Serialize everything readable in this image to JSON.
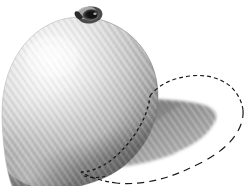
{
  "scene": {
    "title": "Rendered sphere with cast shadow and selection outline",
    "canvas_width": 248,
    "canvas_height": 186,
    "background_color": "#ffffff"
  },
  "object": {
    "name": "textured-sphere",
    "description": "Light gray sphere with diagonal woven texture, stem at top",
    "center_x": 80,
    "center_y": 97,
    "radius_x": 78,
    "radius_y": 80,
    "highlight_x": 52,
    "highlight_y": 58,
    "highlight_color": "#fbfbfb",
    "midtone_color": "#cfcfcf",
    "terminator_color": "#8f8f8f",
    "edge_color": "#6f6f6f",
    "texture_angle_deg": 55,
    "texture_spacing_px": 4,
    "texture_contrast": "low"
  },
  "stem": {
    "name": "stem-calyx",
    "center_x": 90,
    "center_y": 14,
    "width": 22,
    "height": 16,
    "outer_color": "#4a4a4a",
    "inner_color": "#141414",
    "rim_color": "#b9b9b9"
  },
  "shadow": {
    "name": "cast-shadow",
    "description": "Gray crescent cast shadow extending to the lower right",
    "fill_near": "#7e7e7e",
    "fill_far": "#a9a9a9",
    "fill_edge": "#c6c6c6",
    "opacity": 1
  },
  "selection": {
    "name": "marching-ants-selection",
    "description": "Dashed selection outline enclosing the shadow region",
    "stroke_color": "#1a1a1a",
    "stroke_width": 1.2,
    "dash_pattern": "4 3",
    "segments": [
      {
        "label": "top-edge",
        "dash": "4 3"
      },
      {
        "label": "right-edge",
        "dash": "7 5"
      },
      {
        "label": "bottom-edge",
        "dash": "4 3"
      },
      {
        "label": "sphere-edge",
        "dash": "3 3"
      }
    ]
  },
  "colors": {
    "white": "#ffffff",
    "light_gray": "#e4e4e4",
    "mid_gray": "#9a9a9a",
    "dark_gray": "#6a6a6a",
    "near_black": "#141414"
  }
}
